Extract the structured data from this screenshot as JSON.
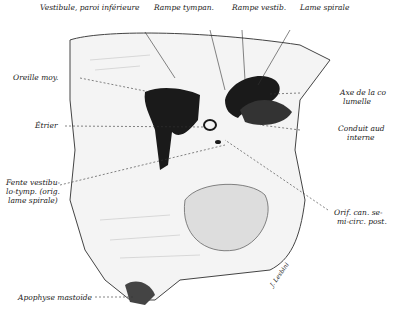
{
  "figure": {
    "labels": {
      "vestibule": "Vestibule, paroi inférieure",
      "rampe_tympan": "Rampe tympan.",
      "rampe_vestib": "Rampe vestib.",
      "lame_spirale": "Lame spirale",
      "oreille_moy": "Oreille moy.",
      "axe_1": "Axe de la co",
      "axe_2": "lumelle",
      "etrier": "Étrier",
      "conduit_1": "Conduit aud",
      "conduit_2": "interne",
      "fente_1": "Fente vestibu-",
      "fente_2": "lo-tymp. (orig.",
      "fente_3": "lame spirale)",
      "orif_1": "Orif. can. se-",
      "orif_2": "mi-circ. post.",
      "apophyse": "Apophyse mastoïde",
      "signature": "J. Lesbini"
    },
    "colors": {
      "ink": "#1a1a1a",
      "paper": "#ffffff",
      "hatch": "#555555"
    }
  }
}
